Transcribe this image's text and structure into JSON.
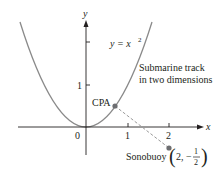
{
  "figure": {
    "axes": {
      "x_label": "x",
      "y_label": "y",
      "origin_label": "0",
      "x_ticks": [
        "1",
        "2"
      ],
      "y_ticks": [
        "1"
      ]
    },
    "curve": {
      "equation_prefix": "y = x",
      "equation_exponent": "2",
      "caption_line1": "Submarine track",
      "caption_line2": "in two dimensions"
    },
    "points": {
      "cpa_label": "CPA",
      "sonobuoy_label": "Sonobuoy",
      "sonobuoy_coord_x": "2,",
      "sonobuoy_coord_sign": "−",
      "sonobuoy_coord_num": "1",
      "sonobuoy_coord_den": "2"
    },
    "colors": {
      "curve": "#8a8a8a",
      "axis": "#231f20",
      "dashed": "#9a9a9a",
      "point": "#6d6e71"
    }
  }
}
